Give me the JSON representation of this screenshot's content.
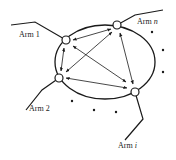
{
  "diagram": {
    "type": "multi-arm interconnection diagram",
    "colors": {
      "stroke": "#1a1a1a",
      "node_fill": "#ffffff",
      "text": "#222222"
    },
    "arms": [
      {
        "id": "arm1",
        "label_prefix": "Arm",
        "label_index": "1",
        "index_italic": false
      },
      {
        "id": "armn",
        "label_prefix": "Arm",
        "label_index": "n",
        "index_italic": true
      },
      {
        "id": "arm2",
        "label_prefix": "Arm",
        "label_index": "2",
        "index_italic": false
      },
      {
        "id": "armi",
        "label_prefix": "Arm",
        "label_index": "i",
        "index_italic": true
      }
    ],
    "connections": [
      [
        "arm1",
        "armn"
      ],
      [
        "arm1",
        "arm2"
      ],
      [
        "arm1",
        "armi"
      ],
      [
        "arm2",
        "armn"
      ],
      [
        "arm2",
        "armi"
      ],
      [
        "armn",
        "armi"
      ]
    ],
    "ellipsis_dots": 6
  }
}
